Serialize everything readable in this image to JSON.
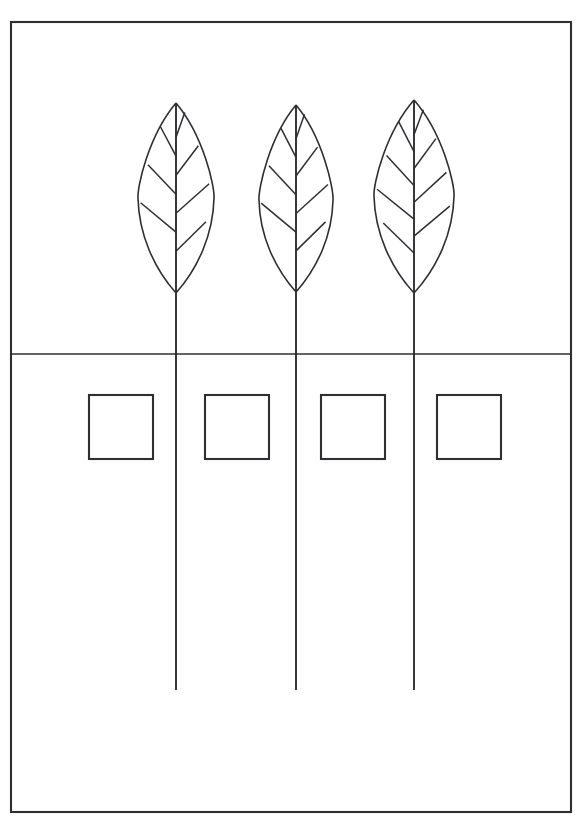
{
  "page": {
    "width": 584,
    "height": 830,
    "background_color": "#ffffff",
    "ink_color": "#2f2f33"
  },
  "frame": {
    "name": "border-rectangle",
    "x": 11,
    "y": 22,
    "width": 560,
    "height": 790,
    "stroke": "#2f2f33",
    "stroke_width": 2.1,
    "fill": "none"
  },
  "ground_line": {
    "name": "horizontal-divider",
    "y": 354,
    "x_start": 11,
    "x_end": 571,
    "stroke": "#2f2f33",
    "stroke_width": 1.7
  },
  "plants": [
    {
      "id": "plant-1",
      "label": "Leaf 1",
      "stem_x": 176,
      "leaf_tip_y": 103,
      "leaf_base_y": 293,
      "leaf_half_width": 38,
      "leaf_widest_y": 198,
      "stem_top_y": 103,
      "stem_bottom_y": 690,
      "vein_count": 7
    },
    {
      "id": "plant-2",
      "label": "Leaf 2",
      "stem_x": 296,
      "leaf_tip_y": 105,
      "leaf_base_y": 292,
      "leaf_half_width": 37,
      "leaf_widest_y": 200,
      "stem_top_y": 105,
      "stem_bottom_y": 690,
      "vein_count": 7
    },
    {
      "id": "plant-3",
      "label": "Leaf 3",
      "stem_x": 414,
      "leaf_tip_y": 100,
      "leaf_base_y": 293,
      "leaf_half_width": 40,
      "leaf_widest_y": 196,
      "stem_top_y": 100,
      "stem_bottom_y": 690,
      "vein_count": 8
    }
  ],
  "squares": [
    {
      "id": "square-1",
      "label": "Square 1",
      "x": 89,
      "y": 395,
      "size": 64
    },
    {
      "id": "square-2",
      "label": "Square 2",
      "x": 205,
      "y": 395,
      "size": 64
    },
    {
      "id": "square-3",
      "label": "Square 3",
      "x": 321,
      "y": 395,
      "size": 64
    },
    {
      "id": "square-4",
      "label": "Square 4",
      "x": 437,
      "y": 395,
      "size": 64
    }
  ],
  "text_labels": []
}
